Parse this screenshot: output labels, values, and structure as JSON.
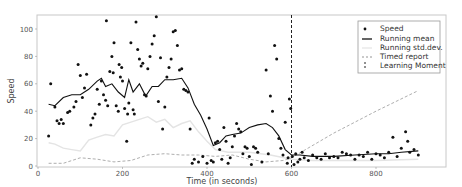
{
  "chart_data": {
    "type": "scatter",
    "title": "",
    "xlabel": "Time (in seconds)",
    "ylabel": "Speed",
    "xlim": [
      0,
      920
    ],
    "ylim": [
      0,
      110
    ],
    "xticks": [
      0,
      200,
      400,
      600,
      800
    ],
    "yticks": [
      0,
      20,
      40,
      60,
      80,
      100
    ],
    "grid": false,
    "legend_position": "upper right",
    "legend": [
      "Speed",
      "Running mean",
      "Running std.dev.",
      "Timed report",
      "Learning Moment"
    ],
    "learning_moment_x": 600,
    "series": [
      {
        "name": "Speed",
        "style": "scatter",
        "points": [
          [
            25,
            22
          ],
          [
            30,
            60
          ],
          [
            40,
            43
          ],
          [
            45,
            33
          ],
          [
            50,
            31
          ],
          [
            55,
            34
          ],
          [
            60,
            31
          ],
          [
            70,
            39
          ],
          [
            75,
            40
          ],
          [
            85,
            43
          ],
          [
            90,
            47
          ],
          [
            95,
            74
          ],
          [
            100,
            66
          ],
          [
            105,
            50
          ],
          [
            110,
            57
          ],
          [
            115,
            67
          ],
          [
            125,
            30
          ],
          [
            130,
            35
          ],
          [
            135,
            38
          ],
          [
            140,
            56
          ],
          [
            145,
            45
          ],
          [
            150,
            62
          ],
          [
            155,
            52
          ],
          [
            160,
            48
          ],
          [
            162,
            106
          ],
          [
            165,
            44
          ],
          [
            170,
            69
          ],
          [
            175,
            80
          ],
          [
            178,
            68
          ],
          [
            180,
            90
          ],
          [
            185,
            44
          ],
          [
            190,
            40
          ],
          [
            192,
            74
          ],
          [
            195,
            65
          ],
          [
            198,
            72
          ],
          [
            200,
            62
          ],
          [
            205,
            42
          ],
          [
            210,
            18
          ],
          [
            212,
            38
          ],
          [
            215,
            46
          ],
          [
            220,
            90
          ],
          [
            225,
            41
          ],
          [
            228,
            38
          ],
          [
            232,
            105
          ],
          [
            236,
            85
          ],
          [
            240,
            78
          ],
          [
            244,
            73
          ],
          [
            248,
            75
          ],
          [
            252,
            52
          ],
          [
            256,
            51
          ],
          [
            260,
            71
          ],
          [
            265,
            80
          ],
          [
            270,
            89
          ],
          [
            275,
            95
          ],
          [
            280,
            109
          ],
          [
            285,
            47
          ],
          [
            290,
            79
          ],
          [
            295,
            27
          ],
          [
            300,
            43
          ],
          [
            305,
            65
          ],
          [
            310,
            72
          ],
          [
            315,
            78
          ],
          [
            320,
            98
          ],
          [
            325,
            99
          ],
          [
            330,
            88
          ],
          [
            335,
            70
          ],
          [
            340,
            71
          ],
          [
            345,
            56
          ],
          [
            350,
            55
          ],
          [
            355,
            54
          ],
          [
            360,
            27
          ],
          [
            365,
            2
          ],
          [
            370,
            5
          ],
          [
            380,
            3
          ],
          [
            390,
            7
          ],
          [
            400,
            2
          ],
          [
            405,
            35
          ],
          [
            410,
            4
          ],
          [
            415,
            3
          ],
          [
            420,
            17
          ],
          [
            425,
            18
          ],
          [
            430,
            12
          ],
          [
            435,
            5
          ],
          [
            440,
            28
          ],
          [
            445,
            18
          ],
          [
            450,
            2
          ],
          [
            455,
            6
          ],
          [
            460,
            14
          ],
          [
            465,
            22
          ],
          [
            470,
            31
          ],
          [
            475,
            27
          ],
          [
            480,
            25
          ],
          [
            485,
            9
          ],
          [
            490,
            14
          ],
          [
            495,
            13
          ],
          [
            500,
            7
          ],
          [
            505,
            1
          ],
          [
            510,
            14
          ],
          [
            515,
            13
          ],
          [
            520,
            10
          ],
          [
            530,
            3
          ],
          [
            540,
            70
          ],
          [
            545,
            9
          ],
          [
            550,
            51
          ],
          [
            555,
            40
          ],
          [
            560,
            88
          ],
          [
            565,
            78
          ],
          [
            570,
            20
          ],
          [
            575,
            13
          ],
          [
            580,
            8
          ],
          [
            585,
            32
          ],
          [
            590,
            2
          ],
          [
            592,
            6
          ],
          [
            595,
            49
          ],
          [
            598,
            42
          ],
          [
            602,
            7
          ],
          [
            606,
            1
          ],
          [
            610,
            9
          ],
          [
            615,
            3
          ],
          [
            620,
            5
          ],
          [
            625,
            10
          ],
          [
            630,
            6
          ],
          [
            640,
            4
          ],
          [
            650,
            8
          ],
          [
            660,
            6
          ],
          [
            670,
            5
          ],
          [
            680,
            9
          ],
          [
            690,
            6
          ],
          [
            700,
            7
          ],
          [
            710,
            6
          ],
          [
            720,
            10
          ],
          [
            730,
            9
          ],
          [
            740,
            8
          ],
          [
            750,
            5
          ],
          [
            760,
            8
          ],
          [
            770,
            7
          ],
          [
            780,
            10
          ],
          [
            790,
            5
          ],
          [
            800,
            9
          ],
          [
            810,
            8
          ],
          [
            820,
            6
          ],
          [
            830,
            10
          ],
          [
            840,
            21
          ],
          [
            850,
            7
          ],
          [
            860,
            13
          ],
          [
            870,
            25
          ],
          [
            875,
            18
          ],
          [
            880,
            10
          ],
          [
            890,
            12
          ],
          [
            900,
            8
          ]
        ]
      },
      {
        "name": "Running mean",
        "style": "line",
        "x": [
          25,
          40,
          60,
          80,
          100,
          120,
          140,
          150,
          160,
          175,
          190,
          205,
          215,
          225,
          240,
          255,
          270,
          285,
          300,
          320,
          340,
          355,
          370,
          385,
          400,
          415,
          430,
          445,
          460,
          480,
          500,
          520,
          540,
          555,
          570,
          585,
          600,
          620,
          650,
          700,
          750,
          800,
          830,
          860,
          900
        ],
        "y": [
          45,
          44,
          50,
          52,
          52,
          56,
          62,
          64,
          58,
          60,
          54,
          50,
          63,
          54,
          60,
          51,
          58,
          58,
          63,
          63,
          64,
          57,
          45,
          37,
          27,
          15,
          17,
          22,
          23,
          24,
          28,
          30,
          31,
          28,
          22,
          12,
          8,
          8,
          7,
          7,
          8,
          9,
          9,
          10,
          11
        ]
      },
      {
        "name": "Running std.dev.",
        "style": "line",
        "x": [
          25,
          40,
          60,
          80,
          100,
          120,
          140,
          160,
          180,
          200,
          220,
          240,
          260,
          280,
          300,
          320,
          340,
          360,
          380,
          400,
          420,
          450,
          500,
          550,
          600,
          650,
          700,
          800,
          900
        ],
        "y": [
          17,
          16,
          13,
          12,
          11,
          19,
          21,
          23,
          22,
          30,
          32,
          34,
          36,
          32,
          34,
          28,
          31,
          33,
          25,
          18,
          12,
          10,
          10,
          8,
          5,
          4,
          4,
          4,
          5
        ]
      },
      {
        "name": "Timed report",
        "style": "dashed",
        "x": [
          25,
          60,
          100,
          140,
          180,
          220,
          260,
          300,
          340,
          380,
          420,
          460,
          500,
          540,
          580,
          600,
          700,
          800,
          900
        ],
        "y": [
          2,
          2,
          6,
          5,
          3,
          4,
          8,
          9,
          8,
          8,
          7,
          8,
          5,
          3,
          4,
          6,
          24,
          40,
          55
        ]
      }
    ]
  }
}
